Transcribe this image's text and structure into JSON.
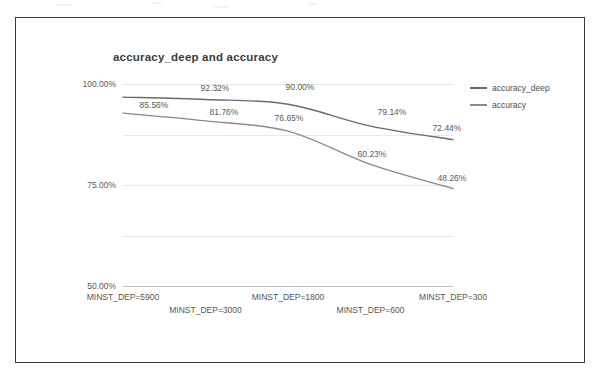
{
  "chart_data": {
    "type": "line",
    "title": "accuracy_deep and accuracy",
    "xlabel": "",
    "ylabel": "",
    "ylim": [
      0,
      1.0
    ],
    "grid": true,
    "legend_position": "right",
    "categories": [
      "MINST_DEP=5900",
      "MINST_DEP=3000",
      "MINST_DEP=1800",
      "MINST_DEP=600",
      "MINST_DEP=300"
    ],
    "y_ticks": [
      "0.00%",
      "25.00%",
      "50.00%",
      "75.00%",
      "100.00%"
    ],
    "y_tick_values": [
      0,
      0.25,
      0.5,
      0.75,
      1.0
    ],
    "series": [
      {
        "name": "accuracy_deep",
        "color": "#6b6b6b",
        "values": [
          0.935,
          0.9232,
          0.9,
          0.7914,
          0.7244
        ],
        "labels": [
          "",
          "92.32%",
          "90.00%",
          "79.14%",
          "72.44%"
        ]
      },
      {
        "name": "accuracy",
        "color": "#8a8a8a",
        "values": [
          0.8556,
          0.8176,
          0.7665,
          0.6023,
          0.4826
        ],
        "labels": [
          "85.56%",
          "81.76%",
          "76.65%",
          "60.23%",
          "48.26%"
        ]
      }
    ],
    "annotations": [
      {
        "text": "85.56%",
        "x": 154,
        "y": 105
      },
      {
        "text": "92.32%",
        "x": 215,
        "y": 88
      },
      {
        "text": "90.00%",
        "x": 300,
        "y": 87
      },
      {
        "text": "81.76%",
        "x": 224,
        "y": 112
      },
      {
        "text": "76.65%",
        "x": 289,
        "y": 118
      },
      {
        "text": "79.14%",
        "x": 392,
        "y": 112
      },
      {
        "text": "60.23%",
        "x": 372,
        "y": 154
      },
      {
        "text": "72.44%",
        "x": 447,
        "y": 128
      },
      {
        "text": "48.26%",
        "x": 452,
        "y": 178
      }
    ]
  },
  "legend": {
    "items": [
      {
        "label": "accuracy_deep",
        "color": "#6b6b6b"
      },
      {
        "label": "accuracy",
        "color": "#8a8a8a"
      }
    ]
  },
  "colors": {
    "frame": "#3a3a3a",
    "grid": "#e9e9e9",
    "axis": "#bdbdbd",
    "text": "#555555",
    "title": "#3d3d3d"
  }
}
